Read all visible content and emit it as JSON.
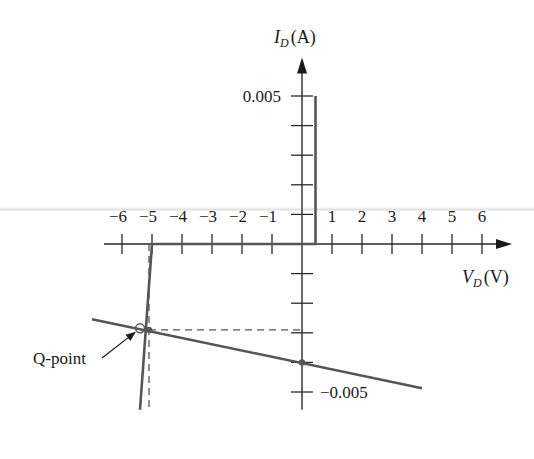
{
  "chart_data": {
    "type": "line",
    "title": "",
    "xlabel": "V_D (V)",
    "xlabel_main": "V",
    "xlabel_sub": "D",
    "xlabel_unit": "(V)",
    "ylabel": "I_D (A)",
    "ylabel_main": "I",
    "ylabel_sub": "D",
    "ylabel_unit": "(A)",
    "xlim": [
      -6.6,
      7.0
    ],
    "ylim": [
      -0.0056,
      0.0063
    ],
    "x_ticks": [
      -6,
      -5,
      -4,
      -3,
      -2,
      -1,
      1,
      2,
      3,
      4,
      5,
      6
    ],
    "x_tick_labels": [
      "−6",
      "−5",
      "−4",
      "−3",
      "−2",
      "−1",
      "1",
      "2",
      "3",
      "4",
      "5",
      "6"
    ],
    "y_ticks": [
      0.005,
      0.004,
      0.003,
      0.002,
      0.001,
      -0.001,
      -0.002,
      -0.003,
      -0.004,
      -0.005
    ],
    "y_tick_labels": [
      {
        "value": 0.005,
        "text": "0.005"
      },
      {
        "value": -0.005,
        "text": "−0.005"
      }
    ],
    "grid": false,
    "series": [
      {
        "name": "Diode characteristic",
        "color": "#555555",
        "x": [
          -5.4,
          -5.0,
          0.45,
          0.45
        ],
        "y": [
          -0.0056,
          0.0,
          0.0,
          0.005
        ]
      },
      {
        "name": "Load line",
        "color": "#555555",
        "x": [
          -7.0,
          4.0
        ],
        "y": [
          -0.00254,
          -0.00487
        ]
      }
    ],
    "guides": [
      {
        "name": "q-point-vertical-guide",
        "x": [
          -5.1,
          -5.1
        ],
        "y": [
          0.0,
          -0.0056
        ]
      },
      {
        "name": "q-point-horizontal-guide",
        "x": [
          -5.1,
          0.0
        ],
        "y": [
          -0.0029,
          -0.0029
        ]
      }
    ],
    "points": [
      {
        "name": "q-point",
        "x": -5.4,
        "y": -0.00285,
        "style": "open-circle"
      },
      {
        "name": "q-point-projection",
        "x": -5.1,
        "y": -0.0029,
        "style": "dot"
      },
      {
        "name": "load-line-y-intercept",
        "x": 0.0,
        "y": -0.004,
        "style": "dot"
      }
    ],
    "annotations": [
      {
        "text": "Q-point",
        "target": "q-point",
        "arrow": true
      }
    ]
  }
}
